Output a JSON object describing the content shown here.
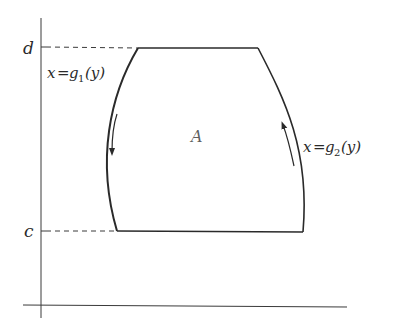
{
  "diagram": {
    "type": "region-between-curves",
    "axes": {
      "x_axis": true,
      "y_axis": true
    },
    "y_levels": {
      "top": {
        "label": "d"
      },
      "bottom": {
        "label": "c"
      }
    },
    "region": {
      "label": "A"
    },
    "curves": [
      {
        "id": "left",
        "label_var": "x",
        "label_eq": "=",
        "label_fn": "g",
        "label_sub": "1",
        "label_arg": "(y)",
        "orientation": "downward"
      },
      {
        "id": "right",
        "label_var": "x",
        "label_eq": "=",
        "label_fn": "g",
        "label_sub": "2",
        "label_arg": "(y)",
        "orientation": "upward"
      }
    ],
    "colors": {
      "ink": "#2a2a2a",
      "background": "#ffffff"
    }
  }
}
